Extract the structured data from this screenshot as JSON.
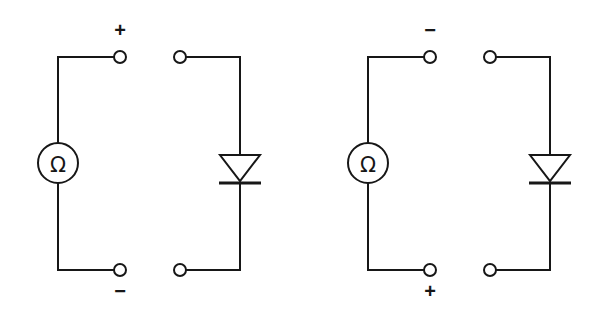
{
  "diagram": {
    "background_color": "#ffffff",
    "line_color": "#171717",
    "stroke_width": 2,
    "width": 600,
    "height": 320
  },
  "circuits": [
    {
      "id": "left",
      "name": "forward-bias-test",
      "meter": {
        "name": "ohmmeter",
        "symbol": "Ω",
        "center_x": 58,
        "center_y": 163,
        "radius": 20
      },
      "meter_branch": {
        "wire_x": 58,
        "top_y": 57,
        "bottom_y": 270,
        "terminal_x": 120
      },
      "terminals": [
        {
          "name": "meter-terminal-top",
          "label": "+",
          "cx": 120,
          "cy": 57,
          "label_x": 120,
          "label_y": 30
        },
        {
          "name": "meter-terminal-bottom",
          "label": "−",
          "cx": 120,
          "cy": 270,
          "label_x": 120,
          "label_y": 286
        }
      ],
      "device_branch": {
        "wire_x": 240,
        "top_y": 57,
        "bottom_y": 270,
        "terminal_x": 180
      },
      "device_terminals": [
        {
          "name": "diode-terminal-top",
          "cx": 180,
          "cy": 57
        },
        {
          "name": "diode-terminal-bottom",
          "cx": 180,
          "cy": 270
        }
      ],
      "diode": {
        "name": "diode",
        "orientation": "cathode-down",
        "apex_y": 181,
        "base_y": 155,
        "half_width": 20,
        "bar_y": 183,
        "bar_half_width": 21
      }
    },
    {
      "id": "right",
      "name": "reverse-bias-test",
      "meter": {
        "name": "ohmmeter",
        "symbol": "Ω",
        "center_x": 368,
        "center_y": 163,
        "radius": 20
      },
      "meter_branch": {
        "wire_x": 368,
        "top_y": 57,
        "bottom_y": 270,
        "terminal_x": 430
      },
      "terminals": [
        {
          "name": "meter-terminal-top",
          "label": "−",
          "cx": 430,
          "cy": 57,
          "label_x": 430,
          "label_y": 30
        },
        {
          "name": "meter-terminal-bottom",
          "label": "+",
          "cx": 430,
          "cy": 270,
          "label_x": 430,
          "label_y": 286
        }
      ],
      "device_branch": {
        "wire_x": 550,
        "top_y": 57,
        "bottom_y": 270,
        "terminal_x": 490
      },
      "device_terminals": [
        {
          "name": "diode-terminal-top",
          "cx": 490,
          "cy": 57
        },
        {
          "name": "diode-terminal-bottom",
          "cx": 490,
          "cy": 270
        }
      ],
      "diode": {
        "name": "diode",
        "orientation": "cathode-down",
        "apex_y": 181,
        "base_y": 155,
        "half_width": 20,
        "bar_y": 183,
        "bar_half_width": 21
      }
    }
  ],
  "labels": {
    "left_top": "+",
    "left_bottom": "−",
    "right_top": "−",
    "right_bottom": "+"
  }
}
